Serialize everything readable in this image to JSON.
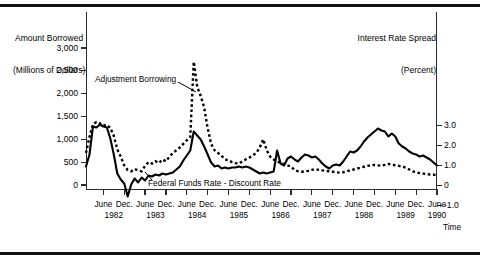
{
  "figure": {
    "left_axis_title_line1": "Amount Borrowed",
    "left_axis_title_line2": "(Millions of Dollars)",
    "right_axis_title_line1": "Interest Rate Spread",
    "right_axis_title_line2": "(Percent)",
    "time_label": "Time"
  },
  "annotations": {
    "adjustment_borrowing": "Adjustment Borrowing",
    "federal_funds_spread": "Federal Funds Rate - Discount Rate"
  },
  "axes": {
    "left_ticks": [
      "3,000",
      "2,500",
      "2,000",
      "1,500",
      "1,000",
      "500",
      "0"
    ],
    "right_ticks": [
      "3.0",
      "2.0",
      "1.0",
      "0",
      "-1.0"
    ],
    "x_months": [
      "June",
      "Dec.",
      "June",
      "Dec.",
      "June",
      "Dec.",
      "June",
      "Dec.",
      "June",
      "Dec.",
      "June",
      "Dec.",
      "June",
      "Dec.",
      "June",
      "Dec.",
      "June"
    ],
    "x_years": [
      "1982",
      "1983",
      "1984",
      "1985",
      "1986",
      "1987",
      "1988",
      "1989",
      "1990"
    ]
  },
  "chart_data": {
    "type": "line",
    "title": "",
    "subtitle": "",
    "xlabel": "Time",
    "ylabel": "Amount Borrowed (Millions of Dollars)",
    "y2label": "Interest Rate Spread (Percent)",
    "ylim": [
      0,
      3000
    ],
    "y2lim": [
      -1.0,
      3.5
    ],
    "xlim": [
      "1982-01",
      "1990-06"
    ],
    "grid": false,
    "legend": "inline-annotations",
    "x": [
      "1982-01",
      "1982-02",
      "1982-03",
      "1982-04",
      "1982-05",
      "1982-06",
      "1982-07",
      "1982-08",
      "1982-09",
      "1982-10",
      "1982-11",
      "1982-12",
      "1983-01",
      "1983-02",
      "1983-03",
      "1983-04",
      "1983-05",
      "1983-06",
      "1983-07",
      "1983-08",
      "1983-09",
      "1983-10",
      "1983-11",
      "1983-12",
      "1984-01",
      "1984-02",
      "1984-03",
      "1984-04",
      "1984-05",
      "1984-06",
      "1984-07",
      "1984-08",
      "1984-09",
      "1984-10",
      "1984-11",
      "1984-12",
      "1985-01",
      "1985-02",
      "1985-03",
      "1985-04",
      "1985-05",
      "1985-06",
      "1985-07",
      "1985-08",
      "1985-09",
      "1985-10",
      "1985-11",
      "1985-12",
      "1986-01",
      "1986-02",
      "1986-03",
      "1986-04",
      "1986-05",
      "1986-06",
      "1986-07",
      "1986-08",
      "1986-09",
      "1986-10",
      "1986-11",
      "1986-12",
      "1987-01",
      "1987-02",
      "1987-03",
      "1987-04",
      "1987-05",
      "1987-06",
      "1987-07",
      "1987-08",
      "1987-09",
      "1987-10",
      "1987-11",
      "1987-12",
      "1988-01",
      "1988-02",
      "1988-03",
      "1988-04",
      "1988-05",
      "1988-06",
      "1988-07",
      "1988-08",
      "1988-09",
      "1988-10",
      "1988-11",
      "1988-12",
      "1989-01",
      "1989-02",
      "1989-03",
      "1989-04",
      "1989-05",
      "1989-06",
      "1989-07",
      "1989-08",
      "1989-09",
      "1989-10",
      "1989-11",
      "1989-12",
      "1990-01",
      "1990-02",
      "1990-03",
      "1990-04",
      "1990-05",
      "1990-06"
    ],
    "series": [
      {
        "name": "Adjustment Borrowing",
        "axis": "left",
        "units": "Millions of Dollars",
        "style": "dotted",
        "values": [
          700,
          1050,
          1330,
          1380,
          1350,
          1300,
          1320,
          1250,
          1080,
          780,
          620,
          430,
          330,
          300,
          350,
          320,
          300,
          420,
          500,
          470,
          520,
          480,
          560,
          520,
          620,
          700,
          760,
          820,
          900,
          980,
          1050,
          2700,
          2150,
          1950,
          1700,
          1250,
          900,
          760,
          700,
          640,
          560,
          540,
          500,
          480,
          470,
          520,
          560,
          600,
          650,
          700,
          820,
          1000,
          760,
          620,
          560,
          520,
          480,
          460,
          430,
          400,
          330,
          300,
          290,
          300,
          310,
          330,
          350,
          330,
          320,
          310,
          300,
          290,
          280,
          270,
          280,
          300,
          320,
          340,
          360,
          380,
          400,
          420,
          430,
          440,
          430,
          420,
          440,
          460,
          450,
          430,
          420,
          400,
          380,
          340,
          300,
          280,
          260,
          250,
          240,
          230,
          225,
          220
        ]
      },
      {
        "name": "Federal Funds Rate - Discount Rate",
        "axis": "right",
        "units": "Percent",
        "style": "solid",
        "values": [
          0.95,
          1.55,
          2.95,
          2.9,
          3.05,
          2.95,
          2.9,
          2.35,
          1.55,
          0.6,
          0.3,
          0.1,
          -0.55,
          0.05,
          0.35,
          0.15,
          0.4,
          0.25,
          0.5,
          0.45,
          0.55,
          0.5,
          0.6,
          0.55,
          0.6,
          0.65,
          0.8,
          0.95,
          1.25,
          1.5,
          1.75,
          2.7,
          2.5,
          2.3,
          1.95,
          1.55,
          1.15,
          0.95,
          1.0,
          0.85,
          0.9,
          0.85,
          0.9,
          0.9,
          0.95,
          0.9,
          0.95,
          0.9,
          0.8,
          0.7,
          0.6,
          0.65,
          0.6,
          0.65,
          0.7,
          1.75,
          1.1,
          1.0,
          1.35,
          1.45,
          1.3,
          1.2,
          1.4,
          1.55,
          1.5,
          1.4,
          1.45,
          1.3,
          1.1,
          0.95,
          0.85,
          1.0,
          1.05,
          1.0,
          1.2,
          1.45,
          1.7,
          1.65,
          1.75,
          1.95,
          2.2,
          2.4,
          2.55,
          2.7,
          2.85,
          2.75,
          2.7,
          2.45,
          2.6,
          2.45,
          2.1,
          1.95,
          1.85,
          1.7,
          1.6,
          1.55,
          1.45,
          1.5,
          1.4,
          1.3,
          1.15,
          1.0
        ]
      }
    ]
  }
}
